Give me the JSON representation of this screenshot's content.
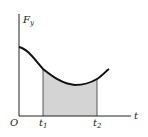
{
  "diagram": {
    "y_axis_label": "F",
    "y_axis_subscript": "y",
    "x_axis_label": "t",
    "origin_label": "O",
    "t1_label": "t",
    "t1_subscript": "1",
    "t2_label": "t",
    "t2_subscript": "2",
    "shade_color": "#d4d4d4",
    "curve_color": "#111111",
    "axis_color": "#222222"
  }
}
